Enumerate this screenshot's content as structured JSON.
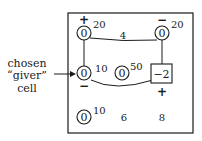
{
  "label": {
    "line1": "chosen",
    "line2": "“giver”",
    "line3": "cell"
  },
  "cells": {
    "r1c1": {
      "value": "0",
      "cost": "20",
      "sign": "+"
    },
    "r1c2": {
      "cost": "4"
    },
    "r1c3": {
      "value": "0",
      "cost": "20",
      "sign": "−"
    },
    "r2c1": {
      "value": "0",
      "cost": "10",
      "sign": "−"
    },
    "r2c2": {
      "value": "0",
      "cost": "50"
    },
    "r2c3": {
      "value": "−2",
      "sign": "+"
    },
    "r3c1": {
      "value": "0",
      "cost": "10"
    },
    "r3c2": {
      "cost": "6"
    },
    "r3c3": {
      "cost": "8"
    }
  }
}
